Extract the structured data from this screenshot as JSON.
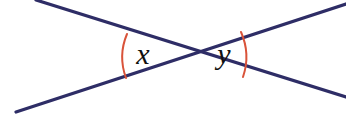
{
  "figure": {
    "type": "geometry-diagram",
    "canvas": {
      "width": 346,
      "height": 114,
      "background": "#ffffff"
    },
    "colors": {
      "line": "#2e2d66",
      "arc": "#d9533a",
      "label": "#111111",
      "background": "#ffffff"
    },
    "intersection": {
      "x": 185,
      "y": 56
    },
    "lines": [
      {
        "name": "line-descending",
        "from": {
          "x": 36,
          "y": 0
        },
        "to": {
          "x": 346,
          "y": 97
        },
        "stroke_width": 3.2
      },
      {
        "name": "line-ascending",
        "from": {
          "x": 16,
          "y": 112
        },
        "to": {
          "x": 346,
          "y": 4
        },
        "stroke_width": 3.2
      }
    ],
    "arcs": [
      {
        "name": "angle-arc-x",
        "side": "left",
        "start": {
          "x": 127,
          "y": 34
        },
        "end": {
          "x": 126,
          "y": 78
        },
        "radius": 60,
        "sweep": 0,
        "stroke_width": 2
      },
      {
        "name": "angle-arc-y",
        "side": "right",
        "start": {
          "x": 241,
          "y": 32
        },
        "end": {
          "x": 243,
          "y": 77
        },
        "radius": 62,
        "sweep": 1,
        "stroke_width": 2
      }
    ],
    "labels": [
      {
        "name": "angle-label-x",
        "text": "x",
        "x": 143,
        "y": 64,
        "font_size": 30
      },
      {
        "name": "angle-label-y",
        "text": "y",
        "x": 224,
        "y": 64,
        "font_size": 30
      }
    ]
  }
}
